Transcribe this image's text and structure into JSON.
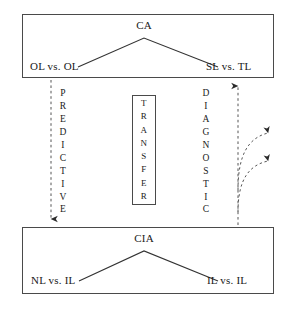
{
  "diagram": {
    "colors": {
      "stroke": "#4a4a4a",
      "line": "#333333",
      "text": "#1a1a1a",
      "background": "#ffffff"
    },
    "top_panel": {
      "name": "contrastive-analysis-panel",
      "apex_label": "CA",
      "left_leaf": "OL vs. OL",
      "right_leaf": "SL vs. TL"
    },
    "bottom_panel": {
      "name": "contrastive-interlanguage-analysis-panel",
      "apex_label": "CIA",
      "left_leaf": "NL vs. IL",
      "right_leaf": "IL vs. IL"
    },
    "transfer_box": {
      "label": "TRANSFER",
      "letters": [
        "T",
        "R",
        "A",
        "N",
        "S",
        "F",
        "E",
        "R"
      ]
    },
    "left_axis": {
      "label": "PREDICTIVE",
      "letters": [
        "P",
        "R",
        "E",
        "D",
        "I",
        "C",
        "T",
        "I",
        "V",
        "E"
      ],
      "direction": "downward"
    },
    "right_axis": {
      "label": "DIAGNOSTIC",
      "letters": [
        "D",
        "I",
        "A",
        "G",
        "N",
        "O",
        "S",
        "T",
        "I",
        "C"
      ],
      "direction": "upward"
    },
    "branch_arrows": {
      "count": 2,
      "style": "dashed-curved",
      "direction": "rightward"
    }
  }
}
